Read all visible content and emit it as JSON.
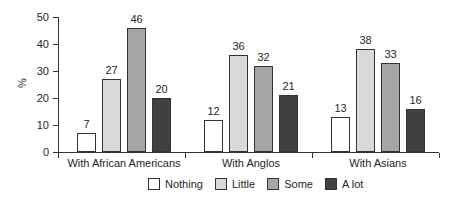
{
  "chart_data": {
    "type": "bar",
    "title": "",
    "xlabel": "",
    "ylabel": "%",
    "ylim": [
      0,
      50
    ],
    "yticks": [
      0,
      10,
      20,
      30,
      40,
      50
    ],
    "grid": false,
    "legend_position": "bottom",
    "categories": [
      "With African Americans",
      "With Anglos",
      "With Asians"
    ],
    "series": [
      {
        "name": "Nothing",
        "color": "#ffffff",
        "values": [
          7,
          12,
          13
        ]
      },
      {
        "name": "Little",
        "color": "#d9d9d9",
        "values": [
          27,
          36,
          38
        ]
      },
      {
        "name": "Some",
        "color": "#a6a6a6",
        "values": [
          46,
          32,
          33
        ]
      },
      {
        "name": "A lot",
        "color": "#404040",
        "values": [
          20,
          21,
          16
        ]
      }
    ]
  },
  "colors": {
    "axis": "#333333",
    "text": "#262626",
    "bar_border": "#333333",
    "background": "#ffffff"
  }
}
